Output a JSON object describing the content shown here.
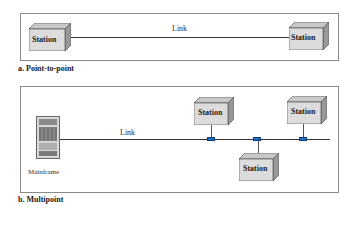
{
  "point_to_point": {
    "caption": "a. Point-to-point",
    "link_label": "Link",
    "stations": [
      {
        "label": "Station"
      },
      {
        "label": "Station"
      }
    ]
  },
  "multipoint": {
    "caption": "b. Multipoint",
    "link_label": "Link",
    "mainframe_label": "Mainframe",
    "stations": [
      {
        "label": "Station"
      },
      {
        "label": "Station"
      },
      {
        "label": "Station"
      }
    ]
  },
  "colors": {
    "connector": "#1f6fc0",
    "station_face": "#dcdcdc"
  }
}
